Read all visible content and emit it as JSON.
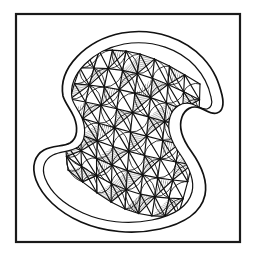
{
  "artwork": {
    "title": "Hand-drawn hatched curvilinear mesh form",
    "medium": "pen and ink line drawing",
    "subject": "S-curved leaf-like organic shell form with triangulated interior mesh",
    "canvas": {
      "width": 256,
      "height": 254,
      "background_color": "#ffffff"
    },
    "frame": {
      "name": "rectangular border frame",
      "x": 16,
      "y": 14,
      "width": 224,
      "height": 228,
      "stroke_color": "#1a1a1a",
      "stroke_width": 2.2,
      "fill_color": "#ffffff"
    },
    "palette": {
      "ink": "#111111",
      "ink_soft": "#2b2b2b",
      "hatch": "#1d1d1d",
      "paper": "#ffffff"
    },
    "outline": {
      "name": "double-contour body outline",
      "description": "Closed S-shaped silhouette: rounded lobe upper-left, deep concave notch on the right under a hooked curl, concave scoop on the lower-left, broad rounded bottom.",
      "stroke_width_outer": 1.7,
      "stroke_width_inner": 1.2,
      "rim_gap": 7,
      "outer_path": "M 63 96 C 58 68 86 40 122 33 C 156 27 186 40 203 58 C 215 71 219 83 222 95 C 224 104 223 111 217 113 C 211 115 206 110 200 108 C 192 105 185 109 182 117 C 178 128 183 140 191 151 C 201 165 208 180 205 195 C 201 213 183 224 160 229 C 133 235 104 232 81 222 C 58 212 42 196 36 180 C 31 166 35 155 44 150 C 53 145 63 147 70 143 C 78 138 78 127 74 117 C 70 108 65 103 63 96 Z",
      "inner_path": "M 72 98 C 68 74 93 50 124 44 C 154 39 180 50 195 66 C 205 77 209 87 211 97 C 213 104 211 108 207 109 C 202 110 198 106 192 104 C 182 101 173 107 170 117 C 166 130 172 143 180 154 C 189 167 195 180 192 192 C 188 207 172 216 152 220 C 128 225 103 222 83 213 C 63 204 50 191 45 178 C 41 167 45 159 53 155 C 61 151 71 152 78 147 C 86 141 86 128 82 118 C 78 109 73 104 72 98 Z"
    },
    "mesh": {
      "name": "curvilinear triangular mesh",
      "row_count": 8,
      "column_count": 8,
      "node_count": 64,
      "grid_line_color": "#141414",
      "grid_line_width": 1.15,
      "arc_line_width": 0.85,
      "hatch_spacing": 2.0,
      "hatch_line_width": 0.6,
      "hatch_angles_deg": [
        78,
        42,
        12,
        118
      ],
      "description": "Warped quadrilateral lattice inside the body, each cell crossed by diagonals and bulging circular arcs; alternating sub-triangles filled with fine parallel hatching."
    }
  }
}
